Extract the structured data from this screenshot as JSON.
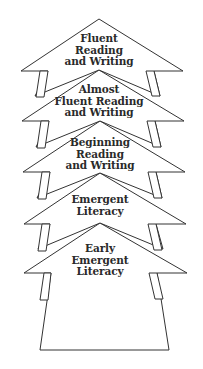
{
  "diagram": {
    "type": "stacked-arrow-progression",
    "direction": "bottom-to-top",
    "stroke_color": "#333333",
    "fill_color": "#ffffff",
    "stages": [
      {
        "order": 5,
        "label": "Fluent\nReading\nand  Writing"
      },
      {
        "order": 4,
        "label": "Almost\nFluent  Reading\nand  Writing"
      },
      {
        "order": 3,
        "label": "Beginning\nReading\nand  Writing"
      },
      {
        "order": 2,
        "label": "Emergent\nLiteracy"
      },
      {
        "order": 1,
        "label": "Early\nEmergent\nLiteracy"
      }
    ]
  }
}
